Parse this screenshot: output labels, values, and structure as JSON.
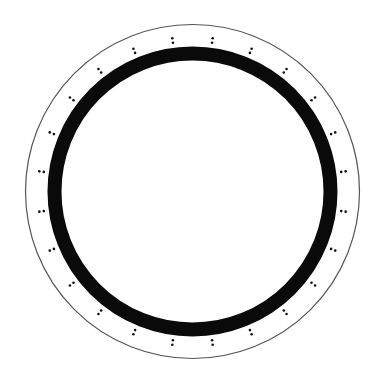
{
  "diagram": {
    "type": "concentric-ring-with-radial-dot-pairs",
    "canvas": {
      "width": 386,
      "height": 379
    },
    "center": {
      "x": 192.5,
      "y": 191.5
    },
    "background_color": "#ffffff",
    "outer_circle": {
      "radius": 167,
      "stroke_width": 1.2,
      "color": "#555555"
    },
    "thick_ring": {
      "radius": 138,
      "stroke_width": 14,
      "color": "#0a0a0a"
    },
    "dot_pairs": {
      "count": 24,
      "start_angle_deg": 7.5,
      "step_deg": 15,
      "inner_radius": 150,
      "outer_radius": 154.5,
      "dot_radius": 1.3,
      "color": "#111111"
    }
  }
}
